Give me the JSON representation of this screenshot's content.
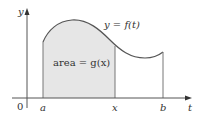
{
  "diagram": {
    "curve_label": "y = f(t)",
    "area_label": "area = g(x)",
    "axes": {
      "y_label": "y",
      "x_label": "t",
      "origin_label": "0"
    },
    "ticks": [
      {
        "label": "a"
      },
      {
        "label": "x"
      },
      {
        "label": "b"
      }
    ],
    "colors": {
      "shade": "#e6e6e6",
      "curve": "#555555",
      "axis": "#555555"
    }
  }
}
